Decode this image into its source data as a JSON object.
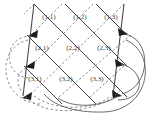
{
  "figure": {
    "background_color": "#ffffff",
    "width": 157,
    "height": 125
  },
  "style": {
    "solid_edge_color": "#2b2b2b",
    "dashed_edge_color": "#6b6b6b",
    "boundary_color": "#4a4a4a",
    "wrap_solid_color": "#5a5a5a",
    "wrap_dashed_color": "#7a7a7a",
    "label_color": "#3a3a3a",
    "arrowhead_color": "#1d1d1d"
  },
  "grid": {
    "rows": 3,
    "cols": 3,
    "nodes": [
      {
        "label": "(1,1)",
        "row": 1,
        "col": 1,
        "x": 49,
        "y": 17
      },
      {
        "label": "(1,2)",
        "row": 1,
        "col": 2,
        "x": 80,
        "y": 17
      },
      {
        "label": "(1,3)",
        "row": 1,
        "col": 3,
        "x": 111,
        "y": 17
      },
      {
        "label": "(2,1)",
        "row": 2,
        "col": 1,
        "x": 42,
        "y": 48
      },
      {
        "label": "(2,2)",
        "row": 2,
        "col": 2,
        "x": 73,
        "y": 48
      },
      {
        "label": "(2,3)",
        "row": 2,
        "col": 3,
        "x": 104,
        "y": 48
      },
      {
        "label": "(3,1)",
        "row": 3,
        "col": 1,
        "x": 35,
        "y": 79
      },
      {
        "label": "(3,2)",
        "row": 3,
        "col": 2,
        "x": 66,
        "y": 79
      },
      {
        "label": "(3,3)",
        "row": 3,
        "col": 3,
        "x": 97,
        "y": 79
      }
    ]
  },
  "legend": {
    "solid_edge_name": "forward-diagonal-edge",
    "dashed_edge_name": "backward-diagonal-edge",
    "wrap_solid_name": "right-wraparound-arc",
    "wrap_dashed_name": "left-wraparound-arc"
  }
}
